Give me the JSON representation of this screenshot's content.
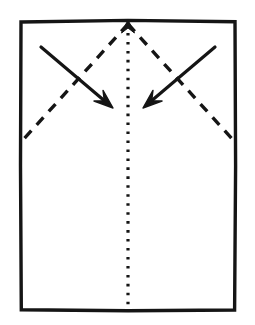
{
  "diagram": {
    "type": "origami-instruction",
    "canvas": {
      "width": 255,
      "height": 325,
      "background": "#ffffff"
    },
    "ink_color": "#151515",
    "paper": {
      "name": "paper-sheet",
      "shape": "rectangle",
      "x": 21,
      "y": 21,
      "width": 214,
      "height": 289,
      "stroke_width": 3.4,
      "fill": "#ffffff",
      "stroke": "#151515"
    },
    "creases": [
      {
        "name": "center-vertical-crease",
        "style": "dotted",
        "meaning": "existing-crease",
        "x1": 128,
        "y1": 24,
        "x2": 128,
        "y2": 309,
        "stroke_width": 3.2,
        "dot_gap": 6.4,
        "has_arrowhead": true,
        "arrowhead_direction": "up",
        "arrowhead_at": {
          "x": 128,
          "y": 24
        }
      },
      {
        "name": "left-valley-fold-line",
        "style": "dashed",
        "meaning": "valley-fold",
        "x1": 128,
        "y1": 24,
        "x2": 22,
        "y2": 141,
        "stroke_width": 3.4,
        "dash_length": 10,
        "dash_gap": 8
      },
      {
        "name": "right-valley-fold-line",
        "style": "dashed",
        "meaning": "valley-fold",
        "x1": 128,
        "y1": 24,
        "x2": 234,
        "y2": 141,
        "stroke_width": 3.4,
        "dash_length": 10,
        "dash_gap": 8
      }
    ],
    "arrows": [
      {
        "name": "left-fold-arrow",
        "style": "solid",
        "meaning": "fold-direction",
        "direction": "down-right",
        "x1": 41,
        "y1": 47,
        "x2": 113,
        "y2": 108,
        "stroke_width": 3.2,
        "head_length": 19,
        "head_half_width": 7
      },
      {
        "name": "right-fold-arrow",
        "style": "solid",
        "meaning": "fold-direction",
        "direction": "down-left",
        "x1": 215,
        "y1": 47,
        "x2": 143,
        "y2": 108,
        "stroke_width": 3.2,
        "head_length": 19,
        "head_half_width": 7
      }
    ]
  }
}
